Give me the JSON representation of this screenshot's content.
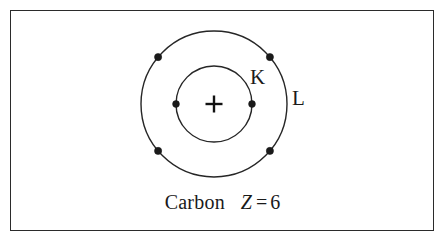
{
  "figure": {
    "kind": "bohr-atom-diagram",
    "frame": {
      "border_color": "#2b2b2b",
      "background": "#ffffff"
    },
    "stroke_color": "#262626",
    "electron_color": "#1a1a1a"
  },
  "atom": {
    "nucleus": {
      "symbol": "+",
      "center_x": 214,
      "center_y": 104
    },
    "shells": [
      {
        "label": "K",
        "name": "k-shell",
        "radius": 38,
        "electron_count": 2,
        "electron_angles_deg": [
          180,
          0
        ]
      },
      {
        "label": "L",
        "name": "l-shell",
        "radius": 73,
        "electron_count": 4,
        "electron_angles_deg": [
          140,
          40,
          220,
          320
        ]
      }
    ]
  },
  "caption": {
    "element_name": "Carbon",
    "z_symbol": "Z",
    "equals": "=",
    "z_value": "6",
    "full_text": "Carbon  Z = 6"
  }
}
